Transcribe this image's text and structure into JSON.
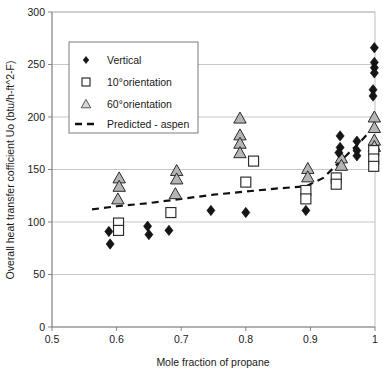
{
  "chart_data": {
    "type": "scatter",
    "title": "",
    "xlabel": "Mole fraction of propane",
    "ylabel": "Overall heat transfer cofficient Uo (btu/h-ft^2-F)",
    "xlim": [
      0.5,
      1.0
    ],
    "ylim": [
      0,
      300
    ],
    "xticks": [
      "0.5",
      "0.6",
      "0.7",
      "0.8",
      "0.9",
      "1"
    ],
    "xtick_values": [
      0.5,
      0.6,
      0.7,
      0.8,
      0.9,
      1.0
    ],
    "yticks": [
      "0",
      "50",
      "100",
      "150",
      "200",
      "250",
      "300"
    ],
    "ytick_values": [
      0,
      50,
      100,
      150,
      200,
      250,
      300
    ],
    "grid": "horizontal",
    "legend_position": "top-left",
    "legend": [
      "Vertical",
      "10°orientation",
      "60°orientation",
      "Predicted - aspen"
    ],
    "series": [
      {
        "name": "Vertical",
        "marker": "diamond",
        "color": "#151515",
        "points": [
          [
            0.588,
            91
          ],
          [
            0.59,
            79
          ],
          [
            0.648,
            96
          ],
          [
            0.65,
            88
          ],
          [
            0.681,
            92
          ],
          [
            0.746,
            111
          ],
          [
            0.8,
            109
          ],
          [
            0.893,
            111
          ],
          [
            0.946,
            182
          ],
          [
            0.946,
            171
          ],
          [
            0.944,
            166
          ],
          [
            0.999,
            266
          ],
          [
            0.999,
            252
          ],
          [
            0.999,
            247
          ],
          [
            0.999,
            242
          ],
          [
            0.997,
            226
          ],
          [
            0.997,
            220
          ],
          [
            0.972,
            177
          ],
          [
            0.972,
            168
          ],
          [
            0.972,
            163
          ]
        ]
      },
      {
        "name": "10°orientation",
        "marker": "square",
        "color": "#ffffff",
        "points": [
          [
            0.603,
            99
          ],
          [
            0.603,
            92
          ],
          [
            0.684,
            109
          ],
          [
            0.8,
            138
          ],
          [
            0.812,
            158
          ],
          [
            0.893,
            130
          ],
          [
            0.893,
            122
          ],
          [
            0.94,
            142
          ],
          [
            0.94,
            136
          ],
          [
            0.998,
            168
          ],
          [
            0.998,
            160
          ],
          [
            0.998,
            153
          ]
        ]
      },
      {
        "name": "60°orientation",
        "marker": "triangle",
        "color": "#b5b5b5",
        "points": [
          [
            0.604,
            142
          ],
          [
            0.604,
            134
          ],
          [
            0.602,
            122
          ],
          [
            0.693,
            149
          ],
          [
            0.693,
            141
          ],
          [
            0.691,
            127
          ],
          [
            0.791,
            199
          ],
          [
            0.791,
            183
          ],
          [
            0.791,
            175
          ],
          [
            0.791,
            166
          ],
          [
            0.896,
            151
          ],
          [
            0.896,
            143
          ],
          [
            0.948,
            161
          ],
          [
            0.948,
            154
          ],
          [
            0.999,
            200
          ],
          [
            0.999,
            190
          ],
          [
            0.999,
            178
          ],
          [
            0.999,
            172
          ]
        ]
      }
    ],
    "trend": {
      "name": "Predicted - aspen",
      "style": "dashed",
      "color": "#111111",
      "points": [
        [
          0.562,
          112
        ],
        [
          0.6,
          115
        ],
        [
          0.65,
          118
        ],
        [
          0.7,
          122
        ],
        [
          0.75,
          126
        ],
        [
          0.8,
          129
        ],
        [
          0.85,
          132
        ],
        [
          0.893,
          134
        ],
        [
          0.92,
          142
        ],
        [
          0.95,
          160
        ],
        [
          0.975,
          175
        ],
        [
          0.998,
          190
        ]
      ]
    }
  }
}
